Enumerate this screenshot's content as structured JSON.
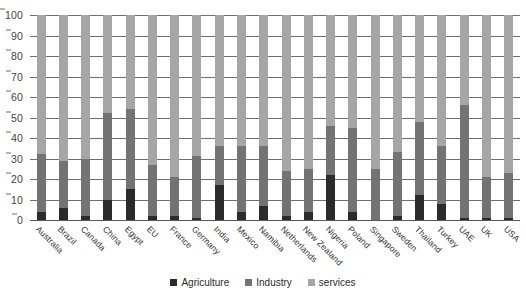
{
  "chart_data": {
    "type": "bar",
    "subtype": "stacked-100-percent",
    "title": "",
    "subtitle": "",
    "xlabel": "",
    "ylabel": "",
    "ylim": [
      0,
      100
    ],
    "yticks": [
      0,
      10,
      20,
      30,
      40,
      50,
      60,
      70,
      80,
      90,
      100
    ],
    "grid": true,
    "legend_position": "bottom-center",
    "categories": [
      "Australia",
      "Brazil",
      "Canada",
      "China",
      "Egypt",
      "EU",
      "France",
      "Germany",
      "India",
      "Mexico",
      "Namibia",
      "Netherlands",
      "New Zealand",
      "Nigeria",
      "Poland",
      "Singapore",
      "Sweden",
      "Thailand",
      "Turkey",
      "UAE",
      "UK",
      "USA"
    ],
    "series": [
      {
        "name": "Agriculture",
        "color": "#2b2b2b",
        "values": [
          4,
          6,
          2,
          10,
          15,
          2,
          2,
          1,
          17,
          4,
          7,
          2,
          4,
          22,
          4,
          0,
          2,
          12,
          8,
          1,
          1,
          1
        ]
      },
      {
        "name": "Industry",
        "color": "#737373",
        "values": [
          28,
          23,
          28,
          42,
          39,
          25,
          19,
          30,
          19,
          32,
          29,
          22,
          21,
          24,
          41,
          25,
          31,
          36,
          28,
          55,
          20,
          22
        ]
      },
      {
        "name": "services",
        "color": "#a6a6a6",
        "values": [
          68,
          71,
          70,
          48,
          46,
          73,
          79,
          69,
          64,
          64,
          64,
          76,
          75,
          54,
          55,
          75,
          67,
          52,
          64,
          44,
          79,
          77
        ]
      }
    ],
    "stack_tops": {
      "agriculture": [
        4,
        6,
        2,
        10,
        15,
        2,
        2,
        1,
        17,
        4,
        7,
        2,
        4,
        22,
        4,
        0,
        2,
        12,
        8,
        1,
        1,
        1
      ],
      "agriculture_plus_industry": [
        32,
        29,
        30,
        52,
        54,
        27,
        21,
        31,
        36,
        36,
        36,
        24,
        25,
        46,
        45,
        25,
        33,
        48,
        36,
        56,
        21,
        23
      ],
      "total": [
        100,
        100,
        100,
        100,
        100,
        100,
        100,
        100,
        100,
        100,
        100,
        100,
        100,
        100,
        100,
        100,
        100,
        100,
        100,
        100,
        100,
        100
      ]
    }
  },
  "legend": {
    "items": [
      {
        "label": "Agriculture",
        "color": "#2b2b2b"
      },
      {
        "label": "Industry",
        "color": "#737373"
      },
      {
        "label": "services",
        "color": "#a6a6a6"
      }
    ]
  }
}
